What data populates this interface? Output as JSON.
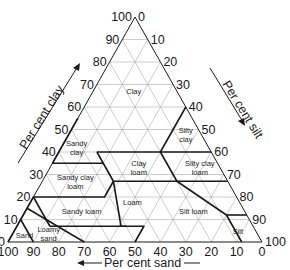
{
  "diagram": {
    "geometry": {
      "apex": [
        135,
        17
      ],
      "left": [
        8,
        242
      ],
      "right": [
        262,
        242
      ]
    },
    "axes": {
      "clay": {
        "label": "Per cent clay",
        "ticks": [
          "0",
          "10",
          "20",
          "30",
          "40",
          "50",
          "60",
          "70",
          "80",
          "90",
          "100"
        ]
      },
      "silt": {
        "label": "Per cent silt",
        "ticks": [
          "0",
          "10",
          "20",
          "30",
          "40",
          "50",
          "60",
          "70",
          "80",
          "90",
          "100"
        ]
      },
      "sand": {
        "label": "Per cent sand",
        "ticks": [
          "100",
          "90",
          "80",
          "70",
          "60",
          "50",
          "40",
          "30",
          "20",
          "10",
          "0"
        ]
      }
    },
    "regions": [
      {
        "name": "Clay",
        "lines": [
          "Clay"
        ],
        "clay": 67,
        "sand": 17
      },
      {
        "name": "Silty clay",
        "lines": [
          "Silty",
          "clay"
        ],
        "clay": 48,
        "sand": 6
      },
      {
        "name": "Sandy clay",
        "lines": [
          "Sandy",
          "clay"
        ],
        "clay": 42,
        "sand": 52
      },
      {
        "name": "Silty clay loam",
        "lines": [
          "Silty clay",
          "loam"
        ],
        "clay": 33,
        "sand": 8
      },
      {
        "name": "Clay loam",
        "lines": [
          "Clay",
          "loam"
        ],
        "clay": 33,
        "sand": 32
      },
      {
        "name": "Sandy clay loam",
        "lines": [
          "Sandy clay",
          "loam"
        ],
        "clay": 27,
        "sand": 60
      },
      {
        "name": "Loam",
        "lines": [
          "Loam"
        ],
        "clay": 18,
        "sand": 42
      },
      {
        "name": "Silt loam",
        "lines": [
          "Silt loam"
        ],
        "clay": 14,
        "sand": 20
      },
      {
        "name": "Sandy loam",
        "lines": [
          "Sandy loam"
        ],
        "clay": 14,
        "sand": 64
      },
      {
        "name": "Silt",
        "lines": [
          "Silt"
        ],
        "clay": 5,
        "sand": 7
      },
      {
        "name": "Loamy sand",
        "lines": [
          "Loamy",
          "sand"
        ],
        "clay": 4,
        "sand": 82
      },
      {
        "name": "Sand",
        "lines": [
          "Sand"
        ],
        "clay": 3,
        "sand": 92
      }
    ],
    "boundaries": [
      [
        [
          40,
          45
        ],
        [
          40,
          20
        ]
      ],
      [
        [
          55,
          45
        ],
        [
          35,
          65
        ]
      ],
      [
        [
          35,
          65
        ],
        [
          35,
          45
        ],
        [
          40,
          45
        ]
      ],
      [
        [
          40,
          20
        ],
        [
          60,
          0
        ]
      ],
      [
        [
          40,
          0
        ],
        [
          40,
          20
        ]
      ],
      [
        [
          27,
          20
        ],
        [
          27,
          0
        ]
      ],
      [
        [
          40,
          20
        ],
        [
          27,
          20
        ],
        [
          27,
          45
        ]
      ],
      [
        [
          35,
          45
        ],
        [
          27,
          45
        ],
        [
          20,
          52
        ],
        [
          20,
          80
        ]
      ],
      [
        [
          27,
          45
        ],
        [
          7,
          52
        ],
        [
          7,
          50
        ]
      ],
      [
        [
          7,
          52
        ],
        [
          7,
          80
        ]
      ],
      [
        [
          27,
          20
        ],
        [
          12,
          8
        ],
        [
          0,
          8
        ]
      ],
      [
        [
          12,
          8
        ],
        [
          12,
          0
        ]
      ],
      [
        [
          0,
          50
        ],
        [
          7,
          43
        ],
        [
          7,
          52
        ]
      ],
      [
        [
          20,
          80
        ],
        [
          15,
          85
        ],
        [
          10,
          90
        ],
        [
          0,
          90
        ]
      ],
      [
        [
          15,
          85
        ],
        [
          0,
          70
        ]
      ],
      [
        [
          10,
          90
        ],
        [
          0,
          100
        ]
      ],
      [
        [
          7,
          80
        ],
        [
          20,
          80
        ]
      ]
    ]
  }
}
